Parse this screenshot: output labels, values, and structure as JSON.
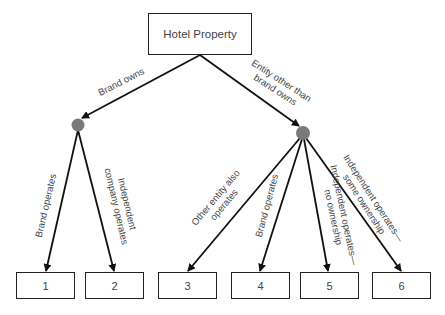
{
  "root": {
    "label": "Hotel Property"
  },
  "branches": [
    {
      "label": "Brand owns"
    },
    {
      "label_line1": "Entity other than",
      "label_line2": "brand owns"
    }
  ],
  "edges": [
    {
      "label": "Brand operates"
    },
    {
      "label_line1": "Independent",
      "label_line2": "company operates"
    },
    {
      "label_line1": "Other entity also",
      "label_line2": "operates"
    },
    {
      "label": "Brand operates"
    },
    {
      "label_line1": "Independent operates—",
      "label_line2": "no ownership"
    },
    {
      "label_line1": "Independent operates—",
      "label_line2": "some ownership"
    }
  ],
  "leaves": [
    {
      "label": "1"
    },
    {
      "label": "2"
    },
    {
      "label": "3"
    },
    {
      "label": "4"
    },
    {
      "label": "5"
    },
    {
      "label": "6"
    }
  ],
  "colors": {
    "node": "#7a7a7a",
    "line": "#111111"
  }
}
